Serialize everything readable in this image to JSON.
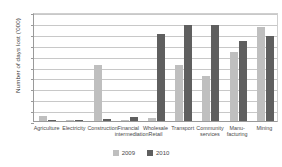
{
  "chart_data": {
    "type": "bar",
    "title": "",
    "xlabel": "",
    "ylabel": "Number of days lost ('000)",
    "ylim": [
      0,
      500
    ],
    "ytick_values": [
      0,
      50,
      100,
      150,
      200,
      250,
      300,
      350,
      400,
      450,
      500
    ],
    "ytick_labels": [
      "0",
      "50",
      "100",
      "150",
      "200",
      "250",
      "300",
      "350",
      "400",
      "450",
      "500"
    ],
    "grid": true,
    "legend_position": "bottom-center",
    "categories": [
      "Agriculture",
      "Electricity",
      "Construction",
      "Financial\nintermediation",
      "Wholesale\nRetail",
      "Transport",
      "Community\nservices",
      "Manu-\nfacturing",
      "Mining"
    ],
    "series": [
      {
        "name": "2009",
        "color": "#bfbfbf",
        "values": [
          22,
          4,
          255,
          3,
          14,
          255,
          205,
          315,
          430
        ]
      },
      {
        "name": "2010",
        "color": "#5f5f5f",
        "values": [
          6,
          2,
          10,
          18,
          400,
          440,
          440,
          365,
          390
        ]
      }
    ]
  },
  "legend": {
    "items": [
      {
        "label": "2009",
        "color": "#bfbfbf"
      },
      {
        "label": "2010",
        "color": "#5f5f5f"
      }
    ]
  },
  "colors": {
    "series_2009": "#bfbfbf",
    "series_2010": "#5f5f5f",
    "gridline": "#c8c8c8",
    "axis": "#9a9a9a",
    "text": "#4a4a4a",
    "background": "#ffffff"
  }
}
